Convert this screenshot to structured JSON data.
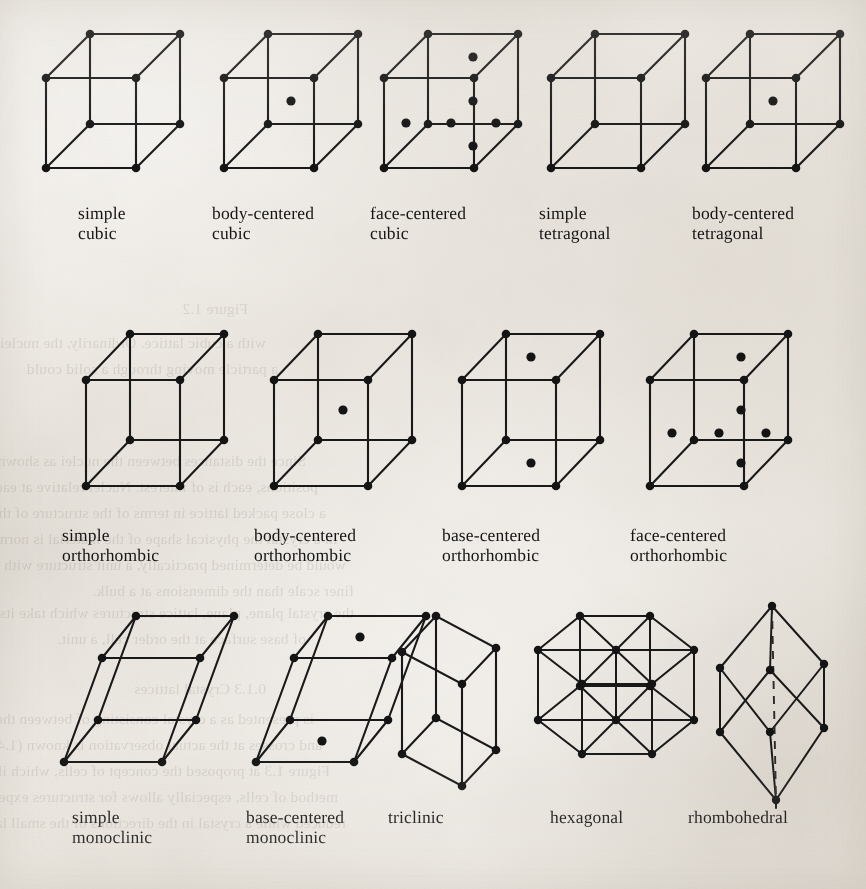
{
  "figure": {
    "ink_color": "#191919",
    "paper_color": "#eeeae4",
    "rows": [
      {
        "row_name": "cubic-and-tetragonal",
        "cells": [
          {
            "id": "simple-cubic",
            "label": "simple\ncubic",
            "shape": "box",
            "centering": "primitive",
            "dots": 0
          },
          {
            "id": "body-centered-cubic",
            "label": "body-centered\ncubic",
            "shape": "box",
            "centering": "body-centered",
            "dots": 1
          },
          {
            "id": "face-centered-cubic",
            "label": "face-centered\ncubic",
            "shape": "box",
            "centering": "face-centered",
            "dots": 6
          },
          {
            "id": "simple-tetragonal",
            "label": "simple\ntetragonal",
            "shape": "box",
            "centering": "primitive",
            "dots": 0
          },
          {
            "id": "body-centered-tetragonal",
            "label": "body-centered\ntetragonal",
            "shape": "box",
            "centering": "body-centered",
            "dots": 1
          }
        ]
      },
      {
        "row_name": "orthorhombic",
        "cells": [
          {
            "id": "simple-orthorhombic",
            "label": "simple\northorhombic",
            "shape": "box",
            "centering": "primitive",
            "dots": 0
          },
          {
            "id": "body-centered-orthorhombic",
            "label": "body-centered\northorhombic",
            "shape": "box",
            "centering": "body-centered",
            "dots": 1
          },
          {
            "id": "base-centered-orthorhombic",
            "label": "base-centered\northorhombic",
            "shape": "box",
            "centering": "base-centered",
            "dots": 2
          },
          {
            "id": "face-centered-orthorhombic",
            "label": "face-centered\northorhombic",
            "shape": "box",
            "centering": "face-centered",
            "dots": 6
          }
        ]
      },
      {
        "row_name": "monoclinic-triclinic-hexagonal-rhombohedral",
        "cells": [
          {
            "id": "simple-monoclinic",
            "label": "simple\nmonoclinic",
            "shape": "sheared-box",
            "centering": "primitive",
            "dots": 0
          },
          {
            "id": "base-centered-monoclinic",
            "label": "base-centered\nmonoclinic",
            "shape": "sheared-box",
            "centering": "base-centered",
            "dots": 2
          },
          {
            "id": "triclinic",
            "label": "triclinic",
            "shape": "skew-box",
            "centering": "primitive",
            "dots": 0
          },
          {
            "id": "hexagonal",
            "label": "hexagonal",
            "shape": "hexagonal-prism",
            "centering": "primitive",
            "dots": 0
          },
          {
            "id": "rhombohedral",
            "label": "rhombohedral",
            "shape": "rhombohedron",
            "centering": "primitive",
            "dots": 0
          }
        ]
      }
    ],
    "bleed_through_lines": [
      {
        "text": "Figure 1.2",
        "x": 618,
        "y": 296
      },
      {
        "text": "with a cubic lattice. Ordinarily, the nuclei",
        "x": 600,
        "y": 330
      },
      {
        "text": "a particle moving through a solid could",
        "x": 588,
        "y": 356
      },
      {
        "text": "Since the distances between the nuclei as shown in the diagram",
        "x": 560,
        "y": 448
      },
      {
        "text": "positions, each is of interest. Nuclei relative at each other would resemble",
        "x": 548,
        "y": 474
      },
      {
        "text": "a close packed lattice in terms of the structure of the real crystal.",
        "x": 540,
        "y": 500
      },
      {
        "text": "In a crystal the physical shape of the material is normally the same as",
        "x": 528,
        "y": 526
      },
      {
        "text": "would be determined practically, a unit structure with parts more at a much",
        "x": 520,
        "y": 552
      },
      {
        "text": "finer scale than the dimensions at a bulk.",
        "x": 512,
        "y": 578
      },
      {
        "text": "0.1.3 Crystal lattices",
        "x": 600,
        "y": 676
      },
      {
        "text": "is presented as a crystal consisting of between the Bravais lattice  cylinders",
        "x": 552,
        "y": 706
      },
      {
        "text": "and crosses at the actual observation is known (1.44) Landau (1974) and",
        "x": 544,
        "y": 732
      },
      {
        "text": "Figure 1.3 at proposed the concept of cells, which illustrates the",
        "x": 536,
        "y": 758
      },
      {
        "text": "method of cells, especially allows for structures expected to be the two most",
        "x": 528,
        "y": 784
      },
      {
        "text": "reduced while a crystal in the directions of the small lattice structures in the most",
        "x": 520,
        "y": 810
      },
      {
        "text": "the crystal plane, plane, lattice structures which take its level at atoms of the",
        "x": 512,
        "y": 600
      },
      {
        "text": "of base surface at the order cell, a unit.",
        "x": 560,
        "y": 626
      }
    ]
  }
}
